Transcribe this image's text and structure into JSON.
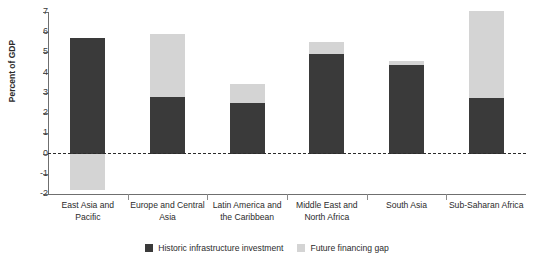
{
  "figure": {
    "title_remnant": "a    y      c     o",
    "ylabel": "Percent of GDP"
  },
  "legend": {
    "items": [
      {
        "label": "Historic infrastructure investment",
        "color": "#3a3a3a",
        "swatch": "square-swatch-dark"
      },
      {
        "label": "Future financing gap",
        "color": "#d4d4d4",
        "swatch": "square-swatch-light"
      }
    ]
  },
  "axis": {
    "y_ticks": [
      "7",
      "6",
      "5",
      "4",
      "3",
      "2",
      "1",
      "0",
      "-1",
      "-2"
    ]
  },
  "chart_data": {
    "type": "bar",
    "stacked": true,
    "title": "",
    "xlabel": "",
    "ylabel": "Percent of GDP",
    "ylim": [
      -2,
      7
    ],
    "yticks": [
      -2,
      -1,
      0,
      1,
      2,
      3,
      4,
      5,
      6,
      7
    ],
    "grid": false,
    "zero_line": true,
    "legend_position": "bottom",
    "categories": [
      "East Asia and Pacific",
      "Europe and Central Asia",
      "Latin America and the Caribbean",
      "Middle East and North Africa",
      "South Asia",
      "Sub-Saharan Africa"
    ],
    "series": [
      {
        "name": "Historic infrastructure investment",
        "color": "#3a3a3a",
        "values": [
          5.7,
          2.8,
          2.5,
          4.9,
          4.4,
          2.75
        ]
      },
      {
        "name": "Future financing gap",
        "color": "#d4d4d4",
        "values": [
          -1.8,
          3.1,
          0.95,
          0.6,
          0.2,
          4.3
        ]
      }
    ],
    "totals": [
      5.7,
      5.9,
      3.45,
      5.5,
      4.6,
      7.05
    ]
  }
}
